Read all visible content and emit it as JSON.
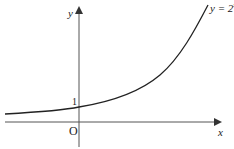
{
  "figure": {
    "function_label": "y = 2",
    "function_exponent": "x",
    "x_axis_label": "x",
    "y_axis_label": "y",
    "origin_label": "O",
    "y_intercept_label": "1"
  },
  "colors": {
    "axis": "#444444",
    "curve": "#222222",
    "text": "#222222"
  }
}
